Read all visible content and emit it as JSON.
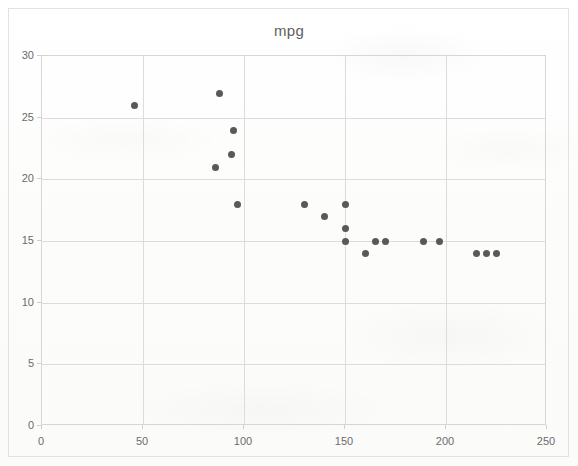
{
  "chart_data": {
    "type": "scatter",
    "title": "mpg",
    "xlabel": "",
    "ylabel": "",
    "xlim": [
      0,
      250
    ],
    "ylim": [
      0,
      30
    ],
    "xticks": [
      0,
      50,
      100,
      150,
      200,
      250
    ],
    "yticks": [
      0,
      5,
      10,
      15,
      20,
      25,
      30
    ],
    "grid": true,
    "legend": "none",
    "marker_color": "#595959",
    "series": [
      {
        "name": "mpg",
        "points": [
          {
            "x": 46,
            "y": 26
          },
          {
            "x": 88,
            "y": 27
          },
          {
            "x": 95,
            "y": 24
          },
          {
            "x": 94,
            "y": 22
          },
          {
            "x": 86,
            "y": 21
          },
          {
            "x": 97,
            "y": 18
          },
          {
            "x": 130,
            "y": 18
          },
          {
            "x": 140,
            "y": 17
          },
          {
            "x": 150,
            "y": 18
          },
          {
            "x": 150,
            "y": 16
          },
          {
            "x": 150,
            "y": 15
          },
          {
            "x": 160,
            "y": 14
          },
          {
            "x": 165,
            "y": 15
          },
          {
            "x": 170,
            "y": 15
          },
          {
            "x": 189,
            "y": 15
          },
          {
            "x": 197,
            "y": 15
          },
          {
            "x": 215,
            "y": 14
          },
          {
            "x": 220,
            "y": 14
          },
          {
            "x": 225,
            "y": 14
          }
        ]
      }
    ]
  }
}
